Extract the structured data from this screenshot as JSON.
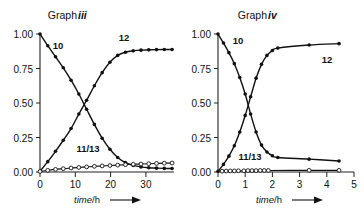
{
  "figure": {
    "background": "#ffffff",
    "ink_color": "#111111"
  },
  "panels": [
    {
      "id": "graph-iii",
      "title_prefix": "Graph ",
      "title_numeral": "iii",
      "xlabel_italic": "time",
      "xlabel_rest": "/h",
      "xlabel_arrow": "arrow-right-icon",
      "xticks": [
        "0",
        "10",
        "20",
        "30"
      ],
      "yticks": [
        "0.00",
        "0.25",
        "0.50",
        "0.75",
        "1.00"
      ],
      "series_labels": {
        "decay": "10",
        "growth": "12",
        "minor": "11/13"
      }
    },
    {
      "id": "graph-iv",
      "title_prefix": "Graph ",
      "title_numeral": "iv",
      "xlabel_italic": "time",
      "xlabel_rest": "/h",
      "xlabel_arrow": "arrow-right-icon",
      "xticks": [
        "0",
        "1",
        "2",
        "3",
        "4",
        "5"
      ],
      "yticks": [
        "0.00",
        "0.25",
        "0.50",
        "0.75",
        "1.00"
      ],
      "series_labels": {
        "decay": "10",
        "growth": "12",
        "minor": "11/13"
      }
    }
  ],
  "chart_data": [
    {
      "type": "line",
      "id": "graph-iii",
      "title": "Graph iii",
      "xlabel": "time/h",
      "ylabel": "",
      "xlim": [
        0,
        34.5
      ],
      "ylim": [
        0.0,
        1.0
      ],
      "xticks": [
        0,
        10,
        20,
        30
      ],
      "yticks": [
        0.0,
        0.25,
        0.5,
        0.75,
        1.0
      ],
      "grid": false,
      "legend": "inline-labels",
      "series": [
        {
          "name": "10",
          "marker": "filled-circle",
          "x": [
            0,
            2,
            4,
            6,
            8,
            10,
            12,
            14,
            16,
            18,
            20,
            22,
            24,
            26,
            28,
            30,
            32,
            34
          ],
          "y": [
            1.0,
            0.915,
            0.835,
            0.755,
            0.665,
            0.565,
            0.455,
            0.345,
            0.245,
            0.165,
            0.105,
            0.068,
            0.048,
            0.037,
            0.031,
            0.028,
            0.026,
            0.025
          ]
        },
        {
          "name": "12",
          "marker": "filled-circle",
          "x": [
            0,
            2,
            4,
            6,
            8,
            10,
            12,
            14,
            16,
            18,
            20,
            22,
            24,
            26,
            28,
            30,
            32,
            34
          ],
          "y": [
            0.005,
            0.075,
            0.15,
            0.23,
            0.315,
            0.42,
            0.52,
            0.625,
            0.72,
            0.795,
            0.845,
            0.868,
            0.878,
            0.883,
            0.885,
            0.887,
            0.888,
            0.888
          ]
        },
        {
          "name": "11/13",
          "marker": "open-circle",
          "x": [
            0,
            2,
            4,
            6,
            8,
            10,
            12,
            14,
            16,
            18,
            20,
            22,
            24,
            26,
            28,
            30,
            32,
            34
          ],
          "y": [
            0.004,
            0.012,
            0.019,
            0.024,
            0.029,
            0.033,
            0.037,
            0.041,
            0.044,
            0.047,
            0.05,
            0.053,
            0.056,
            0.058,
            0.06,
            0.062,
            0.064,
            0.065
          ]
        }
      ]
    },
    {
      "type": "line",
      "id": "graph-iv",
      "title": "Graph iv",
      "xlabel": "time/h",
      "ylabel": "",
      "xlim": [
        0,
        5
      ],
      "ylim": [
        0.0,
        1.0
      ],
      "xticks": [
        0,
        1,
        2,
        3,
        4,
        5
      ],
      "yticks": [
        0.0,
        0.25,
        0.5,
        0.75,
        1.0
      ],
      "grid": false,
      "legend": "inline-labels",
      "series": [
        {
          "name": "10",
          "marker": "filled-circle",
          "x": [
            0,
            0.2,
            0.4,
            0.6,
            0.8,
            1.0,
            1.2,
            1.4,
            1.6,
            1.8,
            2.0,
            2.2,
            3.35,
            4.45
          ],
          "y": [
            1.0,
            0.935,
            0.865,
            0.785,
            0.685,
            0.565,
            0.42,
            0.29,
            0.195,
            0.145,
            0.118,
            0.105,
            0.093,
            0.08
          ]
        },
        {
          "name": "12",
          "marker": "filled-circle",
          "x": [
            0,
            0.2,
            0.4,
            0.6,
            0.8,
            1.0,
            1.2,
            1.4,
            1.6,
            1.8,
            2.0,
            2.2,
            3.35,
            4.45
          ],
          "y": [
            0.005,
            0.055,
            0.115,
            0.19,
            0.29,
            0.41,
            0.545,
            0.68,
            0.78,
            0.845,
            0.88,
            0.898,
            0.92,
            0.93
          ]
        },
        {
          "name": "11/13",
          "marker": "open-circle",
          "x": [
            0.15,
            0.3,
            0.45,
            0.6,
            0.75,
            0.95,
            1.1,
            1.25,
            1.4,
            1.55,
            1.7,
            1.85,
            3.35,
            4.45
          ],
          "y": [
            0.006,
            0.007,
            0.008,
            0.008,
            0.009,
            0.009,
            0.01,
            0.01,
            0.01,
            0.011,
            0.011,
            0.011,
            0.012,
            0.012
          ]
        }
      ]
    }
  ]
}
